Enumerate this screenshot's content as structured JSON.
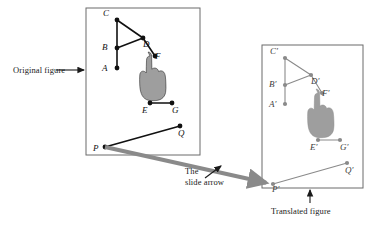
{
  "figure": {
    "title_hidden": "",
    "captions": {
      "original": "Original figure",
      "slide_line1": "The",
      "slide_line2": "slide arrow",
      "translated": "Translated figure"
    },
    "colors": {
      "original_stroke": "#111111",
      "translated_stroke": "#8a8a8a",
      "hand_fill": "#9e9e9e",
      "frame": "#6b6b6b",
      "slide_arrow": "#8a8a8a",
      "text": "#1a1a1a"
    },
    "original_panel": {
      "name": "Original figure",
      "frame": {
        "x": 86,
        "y": 8,
        "width": 114,
        "height": 147
      },
      "points": [
        {
          "label": "C",
          "x": 117,
          "y": 20,
          "label_dx": -10,
          "label_dy": -3
        },
        {
          "label": "B",
          "x": 117,
          "y": 48,
          "label_dx": -11,
          "label_dy": 3
        },
        {
          "label": "A",
          "x": 117,
          "y": 68,
          "label_dx": -11,
          "label_dy": 4
        },
        {
          "label": "D",
          "x": 143,
          "y": 38,
          "label_dx": 4,
          "label_dy": 10
        },
        {
          "label": "F",
          "x": 155,
          "y": 56,
          "label_dx": 4,
          "label_dy": 4
        },
        {
          "label": "E",
          "x": 150,
          "y": 103,
          "label_dx": -4,
          "label_dy": 11
        },
        {
          "label": "G",
          "x": 172,
          "y": 103,
          "label_dx": 4,
          "label_dy": 11
        },
        {
          "label": "Q",
          "x": 180,
          "y": 126,
          "label_dx": 2,
          "label_dy": 11
        },
        {
          "label": "P",
          "x": 105,
          "y": 147,
          "label_dx": -8,
          "label_dy": 5
        }
      ],
      "segments": [
        {
          "from": "C",
          "to": "B"
        },
        {
          "from": "B",
          "to": "A"
        },
        {
          "from": "C",
          "to": "D"
        },
        {
          "from": "B",
          "to": "D"
        },
        {
          "from": "D",
          "to": "F"
        },
        {
          "from": "E",
          "to": "G"
        },
        {
          "from": "P",
          "to": "Q"
        }
      ],
      "hand_anchor": {
        "x": 150,
        "y": 56
      }
    },
    "translated_panel": {
      "name": "Translated figure",
      "frame": {
        "x": 262,
        "y": 45,
        "width": 101,
        "height": 143
      },
      "points": [
        {
          "label": "C′",
          "x": 285,
          "y": 58,
          "label_dx": -11,
          "label_dy": -3
        },
        {
          "label": "B′",
          "x": 285,
          "y": 85,
          "label_dx": -12,
          "label_dy": 3
        },
        {
          "label": "A′",
          "x": 285,
          "y": 104,
          "label_dx": -12,
          "label_dy": 4
        },
        {
          "label": "D′",
          "x": 311,
          "y": 75,
          "label_dx": 4,
          "label_dy": 10
        },
        {
          "label": "F′",
          "x": 322,
          "y": 93,
          "label_dx": 4,
          "label_dy": 4
        },
        {
          "label": "E′",
          "x": 318,
          "y": 140,
          "label_dx": -4,
          "label_dy": 11
        },
        {
          "label": "G′",
          "x": 340,
          "y": 140,
          "label_dx": 4,
          "label_dy": 11
        },
        {
          "label": "Q′",
          "x": 347,
          "y": 163,
          "label_dx": 2,
          "label_dy": 11
        },
        {
          "label": "P′",
          "x": 273,
          "y": 184,
          "label_dx": 3,
          "label_dy": 9
        }
      ],
      "segments": [
        {
          "from": "C′",
          "to": "B′"
        },
        {
          "from": "B′",
          "to": "A′"
        },
        {
          "from": "C′",
          "to": "D′"
        },
        {
          "from": "B′",
          "to": "D′"
        },
        {
          "from": "D′",
          "to": "F′"
        },
        {
          "from": "E′",
          "to": "G′"
        },
        {
          "from": "P′",
          "to": "Q′"
        }
      ],
      "hand_anchor": {
        "x": 318,
        "y": 93
      }
    },
    "slide_arrow": {
      "name": "slide arrow",
      "from": {
        "x": 105,
        "y": 147
      },
      "to": {
        "x": 272,
        "y": 184
      },
      "thickness": 4
    },
    "pointer_arrows": [
      {
        "name": "original-figure-pointer",
        "x1": 56,
        "y1": 70,
        "x2": 84,
        "y2": 70
      },
      {
        "name": "slide-arrow-pointer",
        "x1": 205,
        "y1": 178,
        "x2": 221,
        "y2": 166
      },
      {
        "name": "translated-figure-pointer",
        "x1": 310,
        "y1": 203,
        "x2": 310,
        "y2": 190
      }
    ]
  }
}
